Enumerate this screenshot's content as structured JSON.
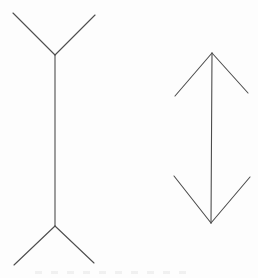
{
  "figure": {
    "background_color": "#fdfdfd",
    "stroke_color": "#4d4d4d",
    "stroke_width": 1.1,
    "canvas": {
      "width": 258,
      "height": 278
    },
    "shapes": [
      {
        "name": "left-shaft",
        "x1": 55,
        "y1": 55,
        "x2": 55,
        "y2": 226
      },
      {
        "name": "left-top-fin-left",
        "x1": 55,
        "y1": 55,
        "x2": 13,
        "y2": 13
      },
      {
        "name": "left-top-fin-right",
        "x1": 55,
        "y1": 55,
        "x2": 95,
        "y2": 15
      },
      {
        "name": "left-bottom-fin-left",
        "x1": 55,
        "y1": 226,
        "x2": 14,
        "y2": 265
      },
      {
        "name": "left-bottom-fin-right",
        "x1": 55,
        "y1": 226,
        "x2": 94,
        "y2": 263
      },
      {
        "name": "right-shaft",
        "x1": 212,
        "y1": 53,
        "x2": 211,
        "y2": 223
      },
      {
        "name": "right-top-fin-left",
        "x1": 212,
        "y1": 53,
        "x2": 175,
        "y2": 96
      },
      {
        "name": "right-top-fin-right",
        "x1": 212,
        "y1": 53,
        "x2": 248,
        "y2": 93
      },
      {
        "name": "right-bottom-fin-left",
        "x1": 211,
        "y1": 223,
        "x2": 174,
        "y2": 176
      },
      {
        "name": "right-bottom-fin-right",
        "x1": 211,
        "y1": 223,
        "x2": 250,
        "y2": 177
      }
    ],
    "caption_remnant": {
      "note": "faint tops of cropped caption letters at bottom edge, illegible"
    }
  }
}
